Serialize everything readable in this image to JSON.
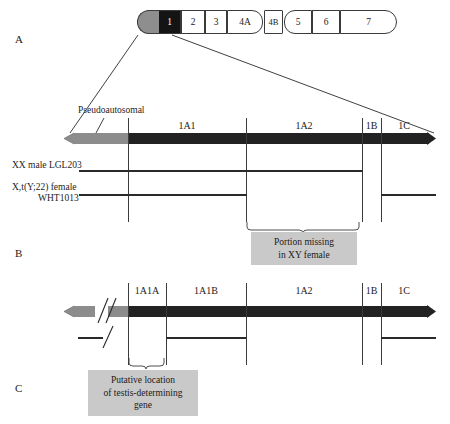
{
  "figure": {
    "panels": [
      {
        "letter": "A"
      },
      {
        "letter": "B"
      },
      {
        "letter": "C"
      }
    ]
  },
  "ideogram": {
    "bands": [
      {
        "label": "",
        "kind": "pseudoautosomal-cap"
      },
      {
        "label": "1",
        "kind": "highlighted"
      },
      {
        "label": "2",
        "kind": "plain"
      },
      {
        "label": "3",
        "kind": "plain"
      },
      {
        "label": "4A",
        "kind": "plain"
      },
      {
        "label": "4B",
        "kind": "centromere"
      },
      {
        "label": "5",
        "kind": "plain"
      },
      {
        "label": "6",
        "kind": "plain"
      },
      {
        "label": "7",
        "kind": "plain"
      }
    ]
  },
  "panel_b": {
    "pseudoautosomal_label": "Pseudoautosomal",
    "regions": [
      {
        "label": "1A1"
      },
      {
        "label": "1A2"
      },
      {
        "label": "1B"
      },
      {
        "label": "1C"
      }
    ],
    "samples": [
      {
        "name_line1": "XX male LGL203",
        "name_line2": ""
      },
      {
        "name_line1": "X,t(Y;22) female",
        "name_line2": "WHT1013"
      }
    ],
    "callout": {
      "line1": "Portion missing",
      "line2": "in XY female"
    }
  },
  "panel_c": {
    "regions": [
      {
        "label": "1A1A"
      },
      {
        "label": "1A1B"
      },
      {
        "label": "1A2"
      },
      {
        "label": "1B"
      },
      {
        "label": "1C"
      }
    ],
    "callout": {
      "line1": "Putative location",
      "line2": "of testis-determining",
      "line3": "gene"
    }
  },
  "colors": {
    "black_bar": "#222222",
    "gray_bar": "#8c8c8c",
    "callout_bg": "#c9c9c9",
    "highlight_band": "#141414"
  }
}
